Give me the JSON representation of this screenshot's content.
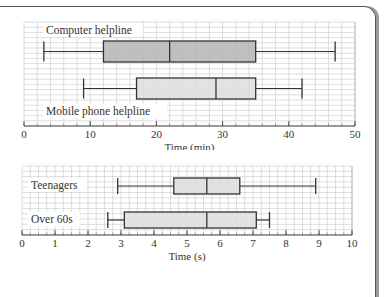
{
  "chart_data": [
    {
      "type": "boxplot",
      "title": "",
      "xlabel": "Time (min)",
      "ylabel": "",
      "xlim": [
        0,
        50
      ],
      "ticks": [
        0,
        10,
        20,
        30,
        40,
        50
      ],
      "tick_labels": [
        "0",
        "10",
        "20",
        "30",
        "40",
        "50"
      ],
      "grid": true,
      "series": [
        {
          "name": "Computer helpline",
          "min": 3,
          "q1": 12,
          "median": 22,
          "q3": 35,
          "max": 47,
          "fill": "#b5b5b5"
        },
        {
          "name": "Mobile phone helpline",
          "min": 9,
          "q1": 17,
          "median": 29,
          "q3": 35,
          "max": 42,
          "fill": "#dedede"
        }
      ]
    },
    {
      "type": "boxplot",
      "title": "",
      "xlabel": "Time (s)",
      "ylabel": "",
      "xlim": [
        0,
        10
      ],
      "ticks": [
        0,
        1,
        2,
        3,
        4,
        5,
        6,
        7,
        8,
        9,
        10
      ],
      "tick_labels": [
        "0",
        "1",
        "2",
        "3",
        "4",
        "5",
        "6",
        "7",
        "8",
        "9",
        "10"
      ],
      "grid": true,
      "series": [
        {
          "name": "Teenagers",
          "min": 2.9,
          "q1": 4.6,
          "median": 5.6,
          "q3": 6.6,
          "max": 8.9,
          "fill": "#dedede"
        },
        {
          "name": "Over 60s",
          "min": 2.6,
          "q1": 3.1,
          "median": 5.6,
          "q3": 7.1,
          "max": 7.5,
          "fill": "#dedede"
        }
      ]
    }
  ],
  "labels": {
    "chart1_series1": "Computer helpline",
    "chart1_series2": "Mobile phone helpline",
    "chart1_xlabel": "Time (min)",
    "chart2_series1": "Teenagers",
    "chart2_series2": "Over 60s",
    "chart2_xlabel": "Time (s)"
  }
}
